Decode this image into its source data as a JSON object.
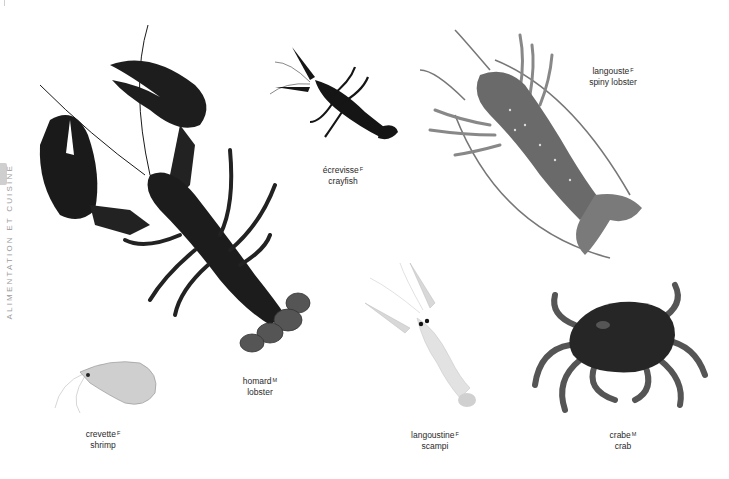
{
  "section": {
    "title": "ALIMENTATION ET CUISINE"
  },
  "items": [
    {
      "id": "lobster",
      "fr": "homard",
      "gender": "M",
      "en": "lobster"
    },
    {
      "id": "crayfish",
      "fr": "écrevisse",
      "gender": "F",
      "en": "crayfish"
    },
    {
      "id": "spiny-lobster",
      "fr": "langouste",
      "gender": "F",
      "en": "spiny lobster"
    },
    {
      "id": "shrimp",
      "fr": "crevette",
      "gender": "F",
      "en": "shrimp"
    },
    {
      "id": "scampi",
      "fr": "langoustine",
      "gender": "F",
      "en": "scampi"
    },
    {
      "id": "crab",
      "fr": "crabe",
      "gender": "M",
      "en": "crab"
    }
  ],
  "colors": {
    "label_text": "#2a2a2a",
    "side_text": "#9a9a9a",
    "lobster": "#1c1c1c",
    "spiny_lobster": "#6e6e6e",
    "scampi": "#d6d6d6",
    "crab": "#2a2a2a",
    "shrimp": "#c8c8c8"
  }
}
